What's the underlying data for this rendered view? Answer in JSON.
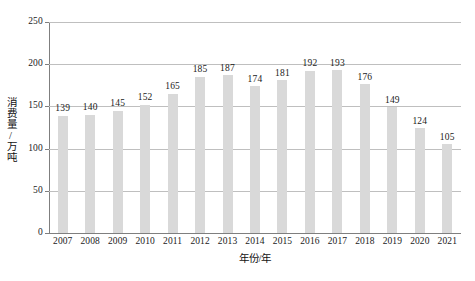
{
  "chart_data": {
    "type": "bar",
    "title": "",
    "xlabel": "年份/年",
    "ylabel": "消费量/万吨",
    "categories": [
      "2007",
      "2008",
      "2009",
      "2010",
      "2011",
      "2012",
      "2013",
      "2014",
      "2015",
      "2016",
      "2017",
      "2018",
      "2019",
      "2020",
      "2021"
    ],
    "values": [
      139,
      140,
      145,
      152,
      165,
      185,
      187,
      174,
      181,
      192,
      193,
      176,
      149,
      124,
      105
    ],
    "series": [
      {
        "name": "消费量",
        "values": [
          139,
          140,
          145,
          152,
          165,
          185,
          187,
          174,
          181,
          192,
          193,
          176,
          149,
          124,
          105
        ]
      }
    ],
    "ylim": [
      0,
      250
    ],
    "yticks": [
      0,
      50,
      100,
      150,
      200,
      250
    ],
    "ytick_labels": [
      "0",
      "50",
      "100",
      "150",
      "200",
      "250"
    ],
    "grid": true,
    "grid_axis": "y",
    "legend": false,
    "bar_color": "#d9d9d9",
    "grid_color": "#bfbfbf",
    "axis_color": "#7f7f7f",
    "data_labels": true
  },
  "caption": ""
}
